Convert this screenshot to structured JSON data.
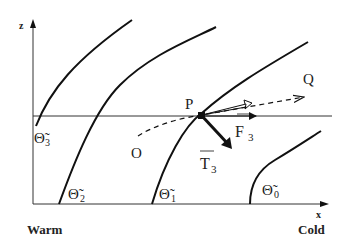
{
  "diagram": {
    "axes": {
      "x_label": "x",
      "z_label": "z"
    },
    "regions": {
      "left": "Warm",
      "right": "Cold"
    },
    "isentropes": [
      {
        "symbol": "Θ̃",
        "subscript": "3"
      },
      {
        "symbol": "Θ̃",
        "subscript": "2"
      },
      {
        "symbol": "Θ̃",
        "subscript": "1"
      },
      {
        "symbol": "Θ̃",
        "subscript": "0"
      }
    ],
    "points": {
      "P": "P",
      "O": "O",
      "Q": "Q"
    },
    "vectors": {
      "F": {
        "symbol": "F",
        "subscript": "3"
      },
      "T": {
        "symbol": "T",
        "subscript": "3"
      }
    },
    "colors": {
      "line": "#111111",
      "background": "#ffffff"
    }
  }
}
